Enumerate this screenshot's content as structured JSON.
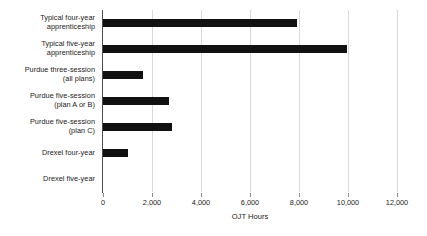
{
  "chart_data": {
    "type": "bar",
    "orientation": "horizontal",
    "title": "",
    "xlabel": "OJT Hours",
    "ylabel": "",
    "xlim": [
      0,
      12000
    ],
    "xticks": [
      0,
      2000,
      4000,
      6000,
      8000,
      10000,
      12000
    ],
    "xtick_labels": [
      "0",
      "2,000",
      "4,000",
      "6,000",
      "8,000",
      "10,000",
      "12,000"
    ],
    "grid": "vertical",
    "legend": "none",
    "bar_color": "#111111",
    "gridline_color": "#d9d9d9",
    "axis_color": "#4d4d4d",
    "categories": [
      "Typical four-year apprenticeship",
      "Typical five-year apprenticeship",
      "Purdue three-session (all plans)",
      "Purdue five-session (plan A or B)",
      "Purdue five-session (plan C)",
      "Drexel four-year",
      "Drexel five-year"
    ],
    "category_lines": [
      [
        "Typical four-year",
        "apprenticeship"
      ],
      [
        "Typical five-year",
        "apprenticeship"
      ],
      [
        "Purdue three-session",
        "(all plans)"
      ],
      [
        "Purdue five-session",
        "(plan A or B)"
      ],
      [
        "Purdue five-session",
        "(plan C)"
      ],
      [
        "Drexel four-year",
        ""
      ],
      [
        "Drexel five-year",
        ""
      ]
    ],
    "values": [
      7900,
      9950,
      1650,
      2700,
      2820,
      1000,
      0
    ]
  }
}
